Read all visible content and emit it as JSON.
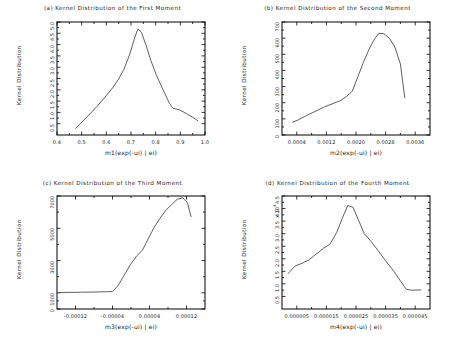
{
  "figure": {
    "background": "#ffffff",
    "line_color": "#4d4d4d",
    "axis_color": "#000000",
    "common_ylabel": "Kernel Distribution"
  },
  "chart_data": [
    {
      "type": "line",
      "panel_id": "a",
      "title": "(a) Kernel Distribution of the First Moment",
      "xlabel": "m1(exp(-ui) | ei)",
      "ylabel": "Kernel Distribution",
      "xlim": [
        0.4,
        1.0
      ],
      "ylim": [
        0.0,
        5.0
      ],
      "xticks": [
        "0.4",
        "0.5",
        "0.6",
        "0.7",
        "0.8",
        "0.9",
        "1.0"
      ],
      "xtick_values": [
        0.4,
        0.5,
        0.6,
        0.7,
        0.8,
        0.9,
        1.0
      ],
      "yticks": [
        "0.5",
        "1.0",
        "1.5",
        "2.0",
        "2.5",
        "3.0",
        "3.5",
        "4.0",
        "4.5",
        "5.0"
      ],
      "ytick_values": [
        0.5,
        1.0,
        1.5,
        2.0,
        2.5,
        3.0,
        3.5,
        4.0,
        4.5,
        5.0
      ],
      "grid": false,
      "legend": "none",
      "x": [
        0.475,
        0.505,
        0.535,
        0.565,
        0.595,
        0.625,
        0.65,
        0.672,
        0.695,
        0.715,
        0.728,
        0.742,
        0.76,
        0.782,
        0.805,
        0.83,
        0.855,
        0.87,
        0.895,
        0.925,
        0.955,
        0.972
      ],
      "y": [
        0.28,
        0.62,
        0.95,
        1.3,
        1.68,
        2.08,
        2.48,
        2.92,
        3.58,
        4.3,
        4.7,
        4.55,
        4.0,
        3.25,
        2.6,
        2.0,
        1.42,
        1.18,
        1.12,
        0.95,
        0.75,
        0.62
      ]
    },
    {
      "type": "line",
      "panel_id": "b",
      "title": "(b) Kernel Distribution of the Second Moment",
      "xlabel": "m2(exp(-ui) | ei)",
      "ylabel": "Kernel Distribution",
      "xlim": [
        0.0,
        0.004
      ],
      "ylim": [
        0,
        700
      ],
      "xticks": [
        "0.0004",
        "0.0012",
        "0.0020",
        "0.0028",
        "0.0036"
      ],
      "xtick_values": [
        0.0004,
        0.0012,
        0.002,
        0.0028,
        0.0036
      ],
      "yticks": [
        "0",
        "100",
        "200",
        "300",
        "400",
        "500",
        "600",
        "700"
      ],
      "ytick_values": [
        0,
        100,
        200,
        300,
        400,
        500,
        600,
        700
      ],
      "grid": false,
      "legend": "none",
      "x": [
        0.00028,
        0.00045,
        0.0007,
        0.00095,
        0.00115,
        0.00135,
        0.0016,
        0.00175,
        0.0019,
        0.00205,
        0.0022,
        0.00235,
        0.0025,
        0.00262,
        0.00275,
        0.0029,
        0.00305,
        0.0032,
        0.00332
      ],
      "y": [
        78,
        95,
        125,
        152,
        175,
        192,
        215,
        240,
        272,
        360,
        450,
        530,
        595,
        630,
        628,
        600,
        545,
        440,
        228
      ]
    },
    {
      "type": "line",
      "panel_id": "c",
      "title": "(c) Kernel Distribution of the Third Moment",
      "xlabel": "m3(exp(-ui) | ei)",
      "ylabel": "Kernel Distribution",
      "xlim": [
        -0.00016,
        0.00016
      ],
      "ylim": [
        0,
        7000
      ],
      "xticks": [
        "-0.00012",
        "-0.00004",
        "0.00004",
        "0.00012"
      ],
      "xtick_values": [
        -0.00012,
        -4e-05,
        4e-05,
        0.00012
      ],
      "yticks": [
        "0",
        "1000",
        "3000",
        "5000",
        "7000"
      ],
      "ytick_values": [
        0,
        1000,
        3000,
        5000,
        7000
      ],
      "grid": false,
      "legend": "none",
      "x": [
        -0.000155,
        -0.00013,
        -0.000105,
        -8e-05,
        -5.5e-05,
        -4e-05,
        -2.8e-05,
        -1.5e-05,
        -2e-06,
        1.2e-05,
        2.5e-05,
        3.8e-05,
        5e-05,
        6.2e-05,
        7.5e-05,
        8.8e-05,
        0.0001,
        0.000112,
        0.000122,
        0.00013
      ],
      "y": [
        1020,
        1030,
        1040,
        1050,
        1070,
        1080,
        1450,
        2080,
        2720,
        3280,
        3650,
        4400,
        5050,
        5600,
        6100,
        6480,
        6800,
        6880,
        6600,
        5700
      ]
    },
    {
      "type": "line",
      "panel_id": "d",
      "title": "(d) Kernel Distribution of the Fourth Moment",
      "xlabel": "m4(exp(-ui) | ei)",
      "ylabel": "Kernel Distribution",
      "y_multiplier": "x 10",
      "y_multiplier_exp": "4",
      "xlim": [
        0.0,
        5e-05
      ],
      "ylim": [
        0.0,
        4.5
      ],
      "xticks": [
        "0.000005",
        "0.000015",
        "0.000025",
        "0.000035",
        "0.000045"
      ],
      "xtick_values": [
        5e-06,
        1.5e-05,
        2.5e-05,
        3.5e-05,
        4.5e-05
      ],
      "yticks": [
        "0.5",
        "1.0",
        "1.5",
        "2.0",
        "2.5",
        "3.0",
        "3.5",
        "4.0",
        "4.5"
      ],
      "ytick_values": [
        0.5,
        1.0,
        1.5,
        2.0,
        2.5,
        3.0,
        3.5,
        4.0,
        4.5
      ],
      "grid": false,
      "legend": "none",
      "x": [
        2e-06,
        4.5e-06,
        6.8e-06,
        9e-06,
        1.15e-05,
        1.4e-05,
        1.62e-05,
        1.85e-05,
        2.05e-05,
        2.22e-05,
        2.4e-05,
        2.58e-05,
        2.78e-05,
        3e-05,
        3.25e-05,
        3.5e-05,
        3.78e-05,
        4e-05,
        4.2e-05,
        4.4e-05,
        4.7e-05
      ],
      "y": [
        1.4,
        1.72,
        1.82,
        1.95,
        2.18,
        2.42,
        2.58,
        3.05,
        3.65,
        4.12,
        4.05,
        3.55,
        3.0,
        2.7,
        2.32,
        1.92,
        1.5,
        1.12,
        0.78,
        0.75,
        0.76
      ]
    }
  ]
}
